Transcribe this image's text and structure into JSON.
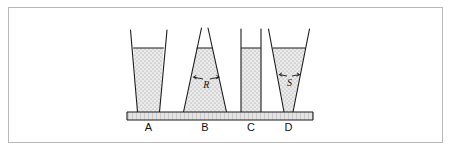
{
  "figure": {
    "border_color": "#b9b9b9",
    "background_color": "#ffffff",
    "ink_color": "#1a1a1a",
    "liquid_fill_color": "#e8e8e8",
    "liquid_stipple_color": "#8c8c8c",
    "base_hatch_color": "#9a9a9a"
  },
  "base": {
    "name": "common-base-plate",
    "label": ""
  },
  "vessels": [
    {
      "id": "A",
      "label": "A",
      "shape": "inverted-truncated-cone-widening-upward",
      "liquid_level_label": "",
      "annotation": ""
    },
    {
      "id": "B",
      "label": "B",
      "shape": "cone-narrowing-upward",
      "liquid_level_label": "",
      "annotation": "R"
    },
    {
      "id": "C",
      "label": "C",
      "shape": "straight-cylinder",
      "liquid_level_label": "",
      "annotation": ""
    },
    {
      "id": "D",
      "label": "D",
      "shape": "funnel-widening-upward",
      "liquid_level_label": "",
      "annotation": "S"
    }
  ],
  "annotations": [
    {
      "id": "R",
      "label": "R",
      "vessel": "B",
      "kind": "wall-force-arrows"
    },
    {
      "id": "S",
      "label": "S",
      "vessel": "D",
      "kind": "wall-force-arrows"
    }
  ]
}
